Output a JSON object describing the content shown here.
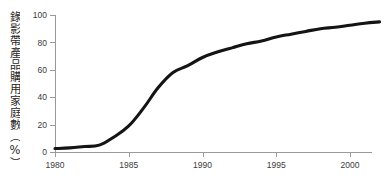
{
  "chart_data": {
    "type": "line",
    "title": "",
    "xlabel": "",
    "ylabel": "錄影帶產品購用家庭數（%）",
    "xlim": [
      1980,
      2002
    ],
    "ylim": [
      0,
      100
    ],
    "grid": false,
    "legend": "none",
    "x_ticks": [
      "1980",
      "1985",
      "1990",
      "1995",
      "2000"
    ],
    "x_tick_values": [
      1980,
      1985,
      1990,
      1995,
      2000
    ],
    "y_ticks": [
      "0",
      "20",
      "40",
      "60",
      "80",
      "100"
    ],
    "y_tick_values": [
      0,
      20,
      40,
      60,
      80,
      100
    ],
    "series": [
      {
        "name": "錄影帶產品購用家庭數",
        "x": [
          1980,
          1981,
          1982,
          1983,
          1984,
          1985,
          1986,
          1987,
          1988,
          1989,
          1990,
          1991,
          1992,
          1993,
          1994,
          1995,
          1996,
          1997,
          1998,
          1999,
          2000,
          2001,
          2002
        ],
        "values": [
          2.5,
          3,
          4,
          5,
          11,
          19,
          32,
          47,
          58,
          63,
          69,
          73,
          76,
          79,
          81,
          84,
          86,
          88,
          90,
          91,
          92.5,
          94,
          95
        ]
      }
    ],
    "line_color": "#141414",
    "axis_color": "#9a9a9a",
    "text_color": "#3b3b3b",
    "background_color": "#ffffff"
  },
  "axis_label": {
    "y_vertical_text": "錄影帶產品購用家庭數（%）"
  }
}
